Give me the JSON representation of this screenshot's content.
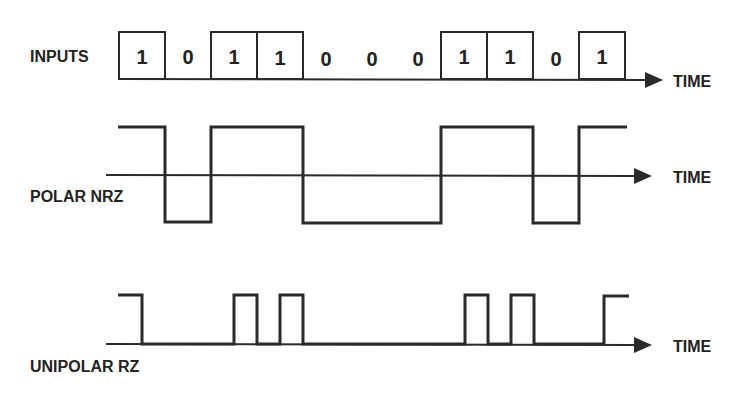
{
  "labels": {
    "inputs": "INPUTS",
    "polar_nrz": "POLAR NRZ",
    "unipolar_rz": "UNIPOLAR RZ",
    "time_1": "TIME",
    "time_2": "TIME",
    "time_3": "TIME"
  },
  "bits": [
    "1",
    "0",
    "1",
    "1",
    "0",
    "0",
    "0",
    "1",
    "1",
    "0",
    "1"
  ],
  "colors": {
    "ink": "#2a2a2a",
    "background": "#ffffff"
  }
}
